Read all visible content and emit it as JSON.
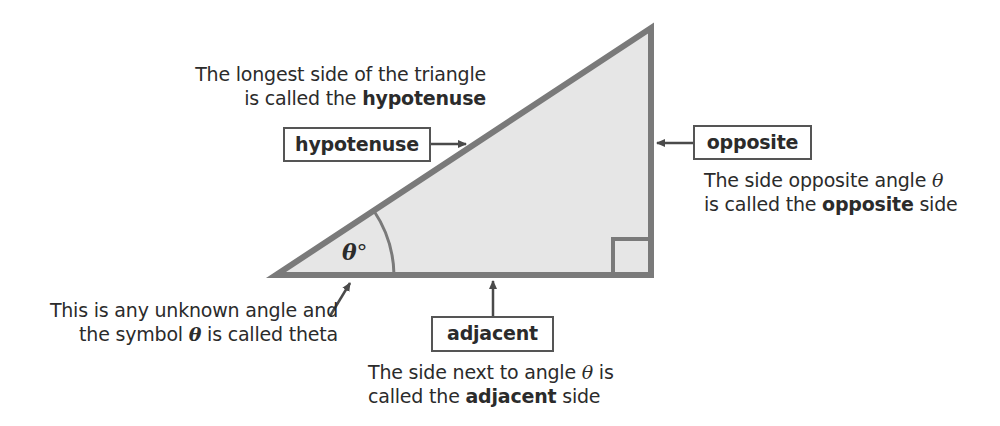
{
  "diagram": {
    "colors": {
      "triangle_fill": "#e6e6e6",
      "triangle_stroke": "#7a7a7a",
      "arrow": "#4a4a4a",
      "box_border": "#555555",
      "text": "#2b2b2b"
    },
    "angle_label": {
      "symbol": "θ",
      "degree": "°"
    },
    "hypotenuse": {
      "box_label": "hypotenuse",
      "desc_line1": "The longest side of the triangle",
      "desc_line2_prefix": "is called the ",
      "desc_line2_bold": "hypotenuse"
    },
    "opposite": {
      "box_label": "opposite",
      "desc_line1_prefix": "The side opposite angle ",
      "desc_line1_symbol": "θ",
      "desc_line2_prefix": "is called the ",
      "desc_line2_bold": "opposite",
      "desc_line2_suffix": " side"
    },
    "adjacent": {
      "box_label": "adjacent",
      "desc_line1_prefix": "The side next to angle ",
      "desc_line1_symbol": "θ",
      "desc_line1_suffix": " is",
      "desc_line2_prefix": "called the ",
      "desc_line2_bold": "adjacent",
      "desc_line2_suffix": " side"
    },
    "theta_note": {
      "line1": "This is any unknown angle and",
      "line2_prefix": "the symbol ",
      "line2_symbol": "θ",
      "line2_suffix": " is called theta"
    }
  }
}
